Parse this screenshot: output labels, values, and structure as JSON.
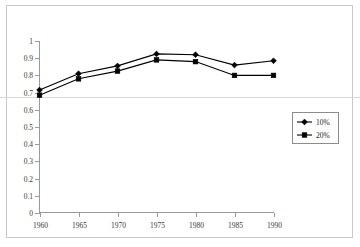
{
  "chart_data": {
    "type": "line",
    "title": "",
    "xlabel": "",
    "ylabel": "",
    "categories": [
      "1960",
      "1965",
      "1970",
      "1975",
      "1980",
      "1985",
      "1990"
    ],
    "x": [
      1960,
      1965,
      1970,
      1975,
      1980,
      1985,
      1990
    ],
    "xlim": [
      1960,
      1990
    ],
    "ylim": [
      0,
      1
    ],
    "y_ticks": [
      "0",
      "0.1",
      "0.2",
      "0.3",
      "0.4",
      "0.5",
      "0.6",
      "0.7",
      "0.8",
      "0.9",
      "1"
    ],
    "y_tick_values": [
      0,
      0.1,
      0.2,
      0.3,
      0.4,
      0.5,
      0.6,
      0.7,
      0.8,
      0.9,
      1
    ],
    "grid": false,
    "legend_position": "right-middle",
    "series": [
      {
        "name": "10%",
        "marker": "diamond",
        "color": "#000000",
        "values": [
          0.715,
          0.81,
          0.855,
          0.925,
          0.92,
          0.86,
          0.885
        ]
      },
      {
        "name": "20%",
        "marker": "square",
        "color": "#000000",
        "values": [
          0.685,
          0.78,
          0.825,
          0.89,
          0.88,
          0.8,
          0.8
        ]
      }
    ]
  },
  "legend": {
    "entries": [
      {
        "label": "10%",
        "marker": "diamond"
      },
      {
        "label": "20%",
        "marker": "square"
      }
    ]
  }
}
